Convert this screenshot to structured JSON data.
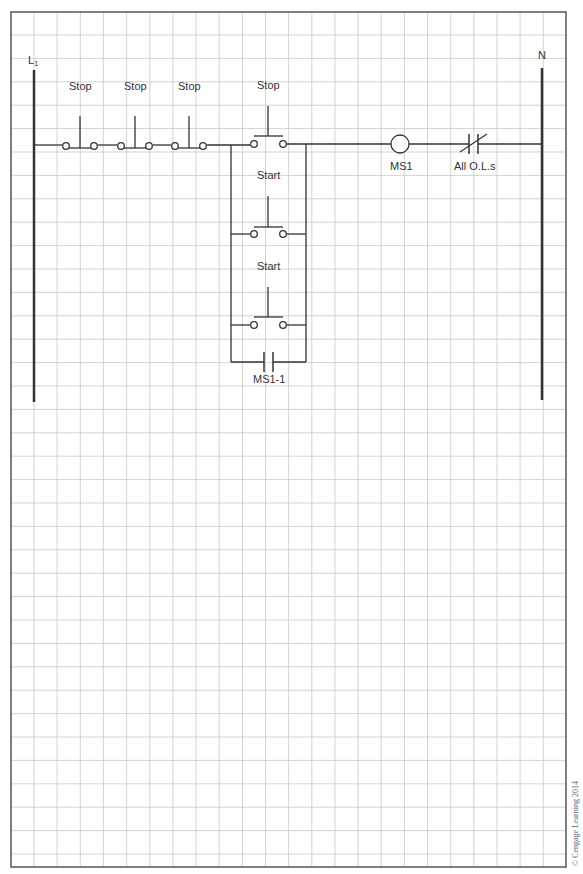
{
  "diagram": {
    "type": "ladder-logic",
    "rails": {
      "left": {
        "label": "L",
        "subscript": "1"
      },
      "right": {
        "label": "N"
      }
    },
    "rung": {
      "series_stops": [
        {
          "label": "Stop",
          "type": "pushbutton-normally-closed"
        },
        {
          "label": "Stop",
          "type": "pushbutton-normally-closed"
        },
        {
          "label": "Stop",
          "type": "pushbutton-normally-closed"
        }
      ],
      "parallel_block": {
        "top": {
          "label": "Stop",
          "type": "pushbutton-normally-open"
        },
        "branches": [
          {
            "label": "Start",
            "type": "pushbutton-normally-open"
          },
          {
            "label": "Start",
            "type": "pushbutton-normally-open"
          },
          {
            "label": "MS1-1",
            "type": "contact-normally-open"
          }
        ]
      },
      "coil": {
        "label": "MS1",
        "type": "coil"
      },
      "overloads": {
        "label": "All O.L.s",
        "type": "contact-normally-closed"
      }
    },
    "colors": {
      "grid": "#c8c8c8",
      "frame": "#555555",
      "wire": "#333333",
      "text": "#333333"
    }
  },
  "footer": {
    "credit": "© Cengage Learning 2014"
  }
}
